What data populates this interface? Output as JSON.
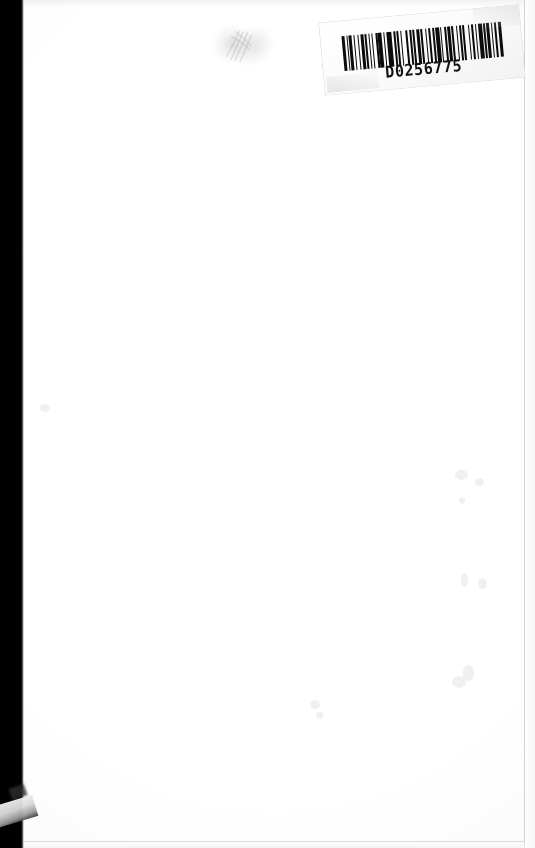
{
  "document": {
    "type": "scanned-book-page",
    "page_content": "",
    "description": "Blank white scanned page with a barcode label affixed at the top right corner"
  },
  "label": {
    "name": "barcode-label",
    "barcode_text": "D0256775",
    "symbology": "Code 39",
    "rotation_degrees": -5.2,
    "bar_pattern": [
      3,
      2,
      1,
      2,
      3,
      2,
      1,
      3,
      2,
      2,
      3,
      1,
      2,
      3,
      1,
      2,
      1,
      3,
      2,
      1,
      4,
      2,
      1,
      2,
      6,
      2,
      2,
      1,
      3,
      2,
      1,
      4,
      2,
      2,
      3,
      1,
      2,
      2,
      4,
      1,
      2,
      3,
      1,
      2,
      3,
      2,
      2,
      1,
      4,
      2,
      1,
      3,
      2,
      1,
      3,
      2,
      2,
      3,
      1,
      2,
      3,
      1,
      2,
      4,
      1,
      2,
      3,
      2,
      1,
      2,
      4,
      2,
      2,
      1,
      3,
      2,
      1,
      3,
      2,
      2,
      3,
      2
    ]
  },
  "artifacts": {
    "scanner_bar_label": "scanner-edge-shadow",
    "smudge_label": "pencil-smudge",
    "corner_patch_label": "torn-corner-patch",
    "speck_label": "paper-speck"
  },
  "colors": {
    "page": "#ffffff",
    "scanner_bar": "#000000",
    "bar_ink": "#0b0b0b",
    "label_face": "#fdfdfd",
    "edge_line": "#c9c9cd",
    "text": "#121212"
  }
}
